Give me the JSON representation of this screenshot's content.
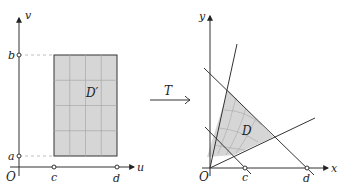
{
  "left_plot": {
    "axis_x_label": "u",
    "axis_y_label": "v",
    "origin_label": "O",
    "tick_labels": {
      "a": "a",
      "b": "b",
      "c": "c",
      "d": "d"
    },
    "region_label": "D′",
    "grid": {
      "columns": 4,
      "rows": 4
    }
  },
  "transform": {
    "label": "T"
  },
  "right_plot": {
    "axis_x_label": "x",
    "axis_y_label": "y",
    "origin_label": "O",
    "tick_labels": {
      "c": "c",
      "d": "d"
    },
    "region_label": "D"
  },
  "colors": {
    "region_fill": "#d6d6d6",
    "line": "#333333",
    "grid": "#a8a8a8",
    "dashed": "#c0c0c0"
  }
}
